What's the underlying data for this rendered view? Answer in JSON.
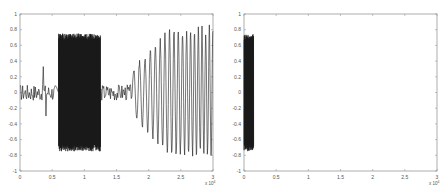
{
  "chart_data": [
    {
      "type": "line",
      "title": "",
      "xlabel": "",
      "ylabel": "",
      "x_exponent_label": "x 10^4",
      "xlim": [
        0,
        3
      ],
      "ylim": [
        -1,
        1
      ],
      "x_ticks": [
        "0",
        "0.5",
        "1",
        "1.5",
        "2",
        "2.5",
        "3"
      ],
      "y_ticks": [
        "1",
        "0.8",
        "0.6",
        "0.4",
        "0.2",
        "0",
        "-0.2",
        "-0.4",
        "-0.6",
        "-0.8",
        "-1"
      ],
      "grid": false,
      "legend": null,
      "line_color": "#1a1a1a",
      "segments": [
        {
          "name": "low-amplitude noise",
          "x_start": 0.0,
          "x_end": 0.6,
          "amplitude": 0.15,
          "peak_max": 0.33,
          "peak_min": -0.3
        },
        {
          "name": "dense high-frequency burst",
          "x_start": 0.6,
          "x_end": 1.25,
          "amplitude": 0.75,
          "peak_max": 0.93,
          "peak_min": -0.9
        },
        {
          "name": "low-amplitude noise",
          "x_start": 1.25,
          "x_end": 1.75,
          "amplitude": 0.15,
          "peak_max": 0.25,
          "peak_min": -0.15
        },
        {
          "name": "chirp-like oscillation",
          "x_start": 1.75,
          "x_end": 3.0,
          "amplitude": 0.85,
          "peak_max": 0.85,
          "peak_min": -0.85
        }
      ]
    },
    {
      "type": "line",
      "title": "",
      "xlabel": "",
      "ylabel": "",
      "x_exponent_label": "x 10^4",
      "xlim": [
        0,
        3
      ],
      "ylim": [
        -1,
        1
      ],
      "x_ticks": [
        "0",
        "0.5",
        "1",
        "1.5",
        "2",
        "2.5",
        "3"
      ],
      "y_ticks": [
        "1",
        "0.8",
        "0.6",
        "0.4",
        "0.2",
        "0",
        "-0.2",
        "-0.4",
        "-0.6",
        "-0.8",
        "-1"
      ],
      "grid": false,
      "legend": null,
      "line_color": "#1a1a1a",
      "segments": [
        {
          "name": "dense burst",
          "x_start": 0.0,
          "x_end": 0.15,
          "amplitude": 0.75,
          "peak_max": 0.76,
          "peak_min": -0.88
        }
      ]
    }
  ]
}
